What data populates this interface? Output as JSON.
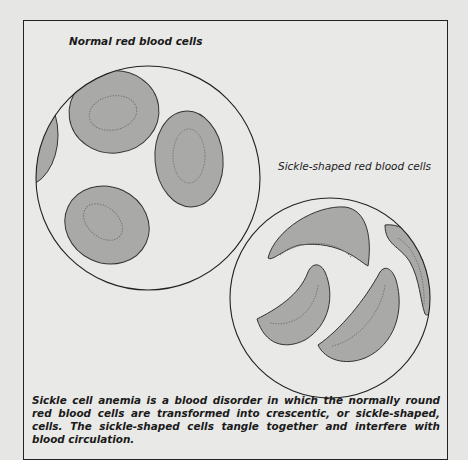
{
  "figure": {
    "normal_label": "Normal red blood cells",
    "sickle_label": "Sickle-shaped red blood cells",
    "caption": "Sickle cell anemia is a blood disorder in which the normally round red blood cells are transformed into crescentic, or sickle-shaped, cells. The sickle-shaped cells tangle together and interfere with blood circulation."
  },
  "colors": {
    "cell_fill": "#a9a9a7",
    "outline": "#333333",
    "background": "#e9e9e7"
  }
}
